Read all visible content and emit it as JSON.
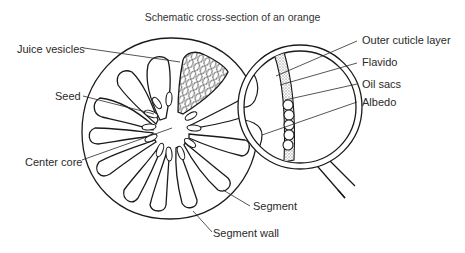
{
  "title": "Schematic cross-section of an orange",
  "labels": {
    "juice_vesicles": "Juice vesicles",
    "seed": "Seed",
    "center_core": "Center core",
    "outer_cuticle_layer": "Outer cuticle layer",
    "flavido": "Flavido",
    "oil_sacs": "Oil sacs",
    "albedo": "Albedo",
    "segment": "Segment",
    "segment_wall": "Segment wall"
  },
  "colors": {
    "line": "#1a1a1a",
    "text": "#2a2a2a",
    "background": "#ffffff",
    "stipple": "#9a9a9a"
  },
  "diagram": {
    "segment_count": 10,
    "magnifier": "magnifying glass showing rind layers",
    "oil_sac_count": 5
  }
}
